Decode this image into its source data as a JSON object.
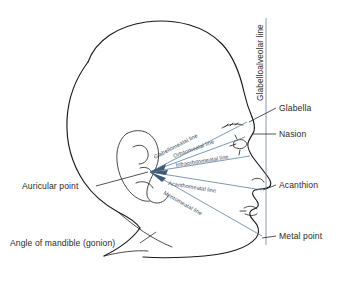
{
  "colors": {
    "outline": "#1a1a1a",
    "ray_line": "#5f7f9c",
    "vertical_line": "#6d8196",
    "label_text": "#2a2a2a",
    "line_label_text": "#3d4f63",
    "background": "#ffffff"
  },
  "point_labels": [
    {
      "id": "glabella",
      "text": "Glabella",
      "name": "label-glabella"
    },
    {
      "id": "nasion",
      "text": "Nasion",
      "name": "label-nasion"
    },
    {
      "id": "acanthion",
      "text": "Acanthion",
      "name": "label-acanthion"
    },
    {
      "id": "metal_point",
      "text": "Metal point",
      "name": "label-metal-point"
    },
    {
      "id": "auricular_point",
      "text": "Auricular point",
      "name": "label-auricular-point"
    },
    {
      "id": "gonion",
      "text": "Angle of mandible (gonion)",
      "name": "label-angle-of-mandible"
    }
  ],
  "line_labels": [
    {
      "id": "glabelloalveolar",
      "text": "Glabelloalveolar line",
      "orientation": "vertical",
      "name": "label-glabelloalveolar-line"
    },
    {
      "id": "glabellomeatal",
      "text": "Glabellomeatal line",
      "orientation": "diagonal",
      "name": "label-glabellomeatal-line"
    },
    {
      "id": "orbitomeatal",
      "text": "Orbitomeatal line",
      "orientation": "diagonal",
      "name": "label-orbitomeatal-line"
    },
    {
      "id": "infraorbitomeatal",
      "text": "Infraorbitomeatal line",
      "orientation": "horizontal",
      "name": "label-infraorbitomeatal-line"
    },
    {
      "id": "acanthomeatal",
      "text": "Acanthomeatal line",
      "orientation": "diagonal",
      "name": "label-acanthomeatal-line"
    },
    {
      "id": "mentomeatal",
      "text": "Mentomeatal line",
      "orientation": "diagonal",
      "name": "label-mentomeatal-line"
    }
  ]
}
